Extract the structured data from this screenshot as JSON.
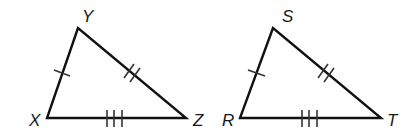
{
  "diagram": {
    "triangles": [
      {
        "name": "triangle-xyz",
        "vertices": {
          "Y": {
            "label": "Y",
            "x": 78,
            "y": 28
          },
          "X": {
            "label": "X",
            "x": 47,
            "y": 118
          },
          "Z": {
            "label": "Z",
            "x": 186,
            "y": 118
          }
        },
        "sides": [
          {
            "from": "X",
            "to": "Y",
            "tick_marks": 1
          },
          {
            "from": "Y",
            "to": "Z",
            "tick_marks": 2
          },
          {
            "from": "X",
            "to": "Z",
            "tick_marks": 3
          }
        ]
      },
      {
        "name": "triangle-rst",
        "vertices": {
          "S": {
            "label": "S",
            "x": 273,
            "y": 28
          },
          "R": {
            "label": "R",
            "x": 240,
            "y": 118
          },
          "T": {
            "label": "T",
            "x": 381,
            "y": 118
          }
        },
        "sides": [
          {
            "from": "R",
            "to": "S",
            "tick_marks": 1
          },
          {
            "from": "S",
            "to": "T",
            "tick_marks": 2
          },
          {
            "from": "R",
            "to": "T",
            "tick_marks": 3
          }
        ]
      }
    ],
    "colors": {
      "line": "#111111",
      "background": "#ffffff"
    }
  }
}
